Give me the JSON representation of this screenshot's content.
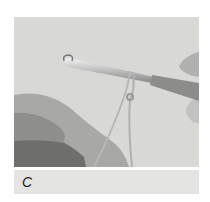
{
  "figure": {
    "image_description": "hands holding a crochet hook with a slip knot loop of yarn",
    "caption": "C"
  },
  "colors": {
    "photo_background": "#d9d9d6",
    "caption_background": "#e4e4e2",
    "caption_text": "#1a1a1a"
  }
}
